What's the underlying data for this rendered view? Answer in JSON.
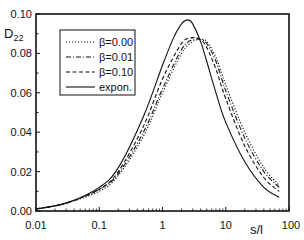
{
  "chart_data": {
    "type": "line",
    "title": "",
    "xlabel": "s/l",
    "ylabel": "D22",
    "xscale": "log",
    "xlim": [
      0.01,
      100
    ],
    "ylim": [
      0.0,
      0.1
    ],
    "x_ticks": [
      "0.01",
      "0.1",
      "1",
      "10",
      "100"
    ],
    "y_ticks": [
      "0.00",
      "0.02",
      "0.04",
      "0.06",
      "0.08",
      "0.10"
    ],
    "grid": false,
    "legend_position": "upper left",
    "series": [
      {
        "name": "β=0.00",
        "style": "dotted",
        "x": [
          0.01,
          0.03,
          0.1,
          0.2,
          0.5,
          1,
          2,
          3,
          4,
          5,
          7,
          10,
          20,
          40,
          70
        ],
        "values": [
          0.001,
          0.004,
          0.01,
          0.018,
          0.038,
          0.06,
          0.08,
          0.086,
          0.087,
          0.086,
          0.078,
          0.064,
          0.04,
          0.022,
          0.013
        ]
      },
      {
        "name": "β=0.01",
        "style": "dash-dot",
        "x": [
          0.01,
          0.03,
          0.1,
          0.2,
          0.5,
          1,
          2,
          3,
          4,
          5,
          7,
          10,
          20,
          40,
          70
        ],
        "values": [
          0.001,
          0.004,
          0.011,
          0.019,
          0.04,
          0.062,
          0.082,
          0.087,
          0.087,
          0.085,
          0.076,
          0.061,
          0.037,
          0.02,
          0.012
        ]
      },
      {
        "name": "β=0.10",
        "style": "dashed",
        "x": [
          0.01,
          0.03,
          0.1,
          0.2,
          0.5,
          1,
          2,
          3,
          4,
          5,
          7,
          10,
          20,
          40,
          70
        ],
        "values": [
          0.001,
          0.004,
          0.011,
          0.02,
          0.043,
          0.067,
          0.085,
          0.088,
          0.087,
          0.083,
          0.072,
          0.057,
          0.033,
          0.017,
          0.01
        ]
      },
      {
        "name": "expon.",
        "style": "solid",
        "x": [
          0.01,
          0.03,
          0.1,
          0.2,
          0.5,
          1,
          1.5,
          2,
          2.5,
          3,
          4,
          5,
          7,
          10,
          20,
          40,
          70
        ],
        "values": [
          0.001,
          0.004,
          0.012,
          0.022,
          0.048,
          0.074,
          0.088,
          0.095,
          0.097,
          0.095,
          0.086,
          0.076,
          0.06,
          0.045,
          0.025,
          0.012,
          0.007
        ]
      }
    ]
  }
}
